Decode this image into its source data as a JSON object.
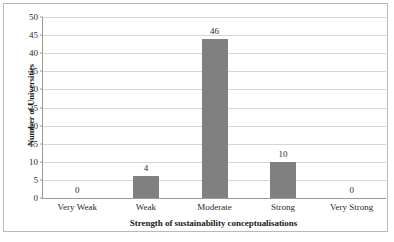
{
  "chart_data": {
    "type": "bar",
    "title": "",
    "xlabel": "Strength of sustainability conceptualisations",
    "ylabel": "Number of Universities",
    "categories": [
      "Very Weak",
      "Weak",
      "Moderate",
      "Strong",
      "Very Strong"
    ],
    "category_lines": [
      [
        "Very",
        "Weak"
      ],
      [
        "Weak"
      ],
      [
        "Moderate"
      ],
      [
        "Strong"
      ],
      [
        "Very",
        "Strong"
      ]
    ],
    "values": [
      0,
      4,
      46,
      10,
      0
    ],
    "data_labels": [
      "0",
      "4",
      "46",
      "10",
      "0"
    ],
    "bar_pixel_values": [
      0,
      6,
      44,
      10,
      0
    ],
    "ylim": [
      0,
      50
    ],
    "yticks": [
      "0",
      "5",
      "10",
      "15",
      "20",
      "25",
      "30",
      "35",
      "40",
      "45",
      "50"
    ],
    "ytick_values": [
      0,
      5,
      10,
      15,
      20,
      25,
      30,
      35,
      40,
      45,
      50
    ],
    "grid": true,
    "legend": "none",
    "colors": {
      "bar": "#808080",
      "gridline": "#d6d6d6",
      "axis": "#9a9a9a",
      "frame": "#b9b9b9",
      "text": "#2b2b2b",
      "background": "#ffffff"
    }
  }
}
